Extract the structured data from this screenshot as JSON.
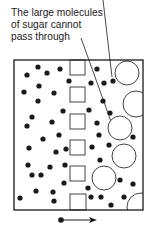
{
  "annotation": {
    "lines": [
      "The large molecules",
      "of sugar cannot",
      "pass through"
    ]
  },
  "colors": {
    "ink": "#1a1a1a",
    "outline": "#444444",
    "background": "#ffffff"
  },
  "container": {
    "x": 14,
    "y": 60,
    "width": 129,
    "height": 150
  },
  "membrane_pores": [
    {
      "x": 70,
      "y": 60,
      "size": 15
    },
    {
      "x": 70,
      "y": 87,
      "size": 15
    },
    {
      "x": 70,
      "y": 114,
      "size": 15
    },
    {
      "x": 70,
      "y": 140,
      "size": 15
    },
    {
      "x": 70,
      "y": 166,
      "size": 15
    },
    {
      "x": 70,
      "y": 194,
      "size": 16
    }
  ],
  "water_molecules": [
    [
      38,
      67
    ],
    [
      27,
      75
    ],
    [
      47,
      73
    ],
    [
      60,
      69
    ],
    [
      69,
      81
    ],
    [
      39,
      86
    ],
    [
      24,
      92
    ],
    [
      54,
      93
    ],
    [
      38,
      101
    ],
    [
      63,
      111
    ],
    [
      32,
      117
    ],
    [
      27,
      126
    ],
    [
      52,
      122
    ],
    [
      59,
      135
    ],
    [
      43,
      139
    ],
    [
      29,
      148
    ],
    [
      56,
      152
    ],
    [
      66,
      149
    ],
    [
      28,
      165
    ],
    [
      50,
      167
    ],
    [
      65,
      165
    ],
    [
      32,
      175
    ],
    [
      41,
      175
    ],
    [
      64,
      183
    ],
    [
      36,
      191
    ],
    [
      53,
      192
    ],
    [
      20,
      198
    ],
    [
      54,
      201
    ],
    [
      97,
      69
    ],
    [
      91,
      83
    ],
    [
      104,
      83
    ],
    [
      113,
      81
    ],
    [
      103,
      101
    ],
    [
      89,
      110
    ],
    [
      110,
      113
    ],
    [
      97,
      123
    ],
    [
      133,
      137
    ],
    [
      99,
      135
    ],
    [
      109,
      145
    ],
    [
      92,
      147
    ],
    [
      100,
      160
    ],
    [
      120,
      180
    ],
    [
      133,
      184
    ],
    [
      88,
      188
    ],
    [
      91,
      197
    ],
    [
      101,
      197
    ],
    [
      124,
      197
    ],
    [
      111,
      205
    ]
  ],
  "sugar_molecules": [
    {
      "cx": 127,
      "cy": 73,
      "r": 12
    },
    {
      "cx": 136,
      "cy": 104,
      "r": 13
    },
    {
      "cx": 120,
      "cy": 128,
      "r": 12
    },
    {
      "cx": 124,
      "cy": 156,
      "r": 12
    },
    {
      "cx": 104,
      "cy": 178,
      "r": 12
    },
    {
      "cx": 141,
      "cy": 207,
      "r": 14
    }
  ],
  "pointer_lines": [
    {
      "x1": 103,
      "y1": 0,
      "x2": 112,
      "y2": 77
    },
    {
      "x1": 81,
      "y1": 38,
      "x2": 113,
      "y2": 127
    }
  ],
  "flow_arrow": {
    "x1": 61,
    "y1": 220,
    "x2": 97,
    "y2": 220,
    "direction": "right"
  }
}
